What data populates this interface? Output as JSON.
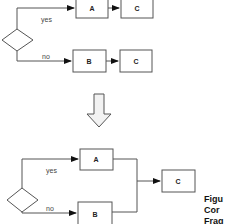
{
  "top_diagram": {
    "decision": {
      "shape": "diamond"
    },
    "yes_label": "yes",
    "no_label": "no",
    "yes_branch": [
      "A",
      "C"
    ],
    "no_branch": [
      "B",
      "C"
    ]
  },
  "transform_arrow": {
    "icon": "down-arrow-icon"
  },
  "bottom_diagram": {
    "decision": {
      "shape": "diamond"
    },
    "yes_label": "yes",
    "no_label": "no",
    "node_a": "A",
    "node_b": "B",
    "merged_node": "C"
  },
  "caption": {
    "line1": "Figu",
    "line2": "Cor",
    "line3": "Frag"
  },
  "colors": {
    "stroke": "#555555",
    "arrow_fill": "#f2f2f2",
    "text": "#222222"
  }
}
